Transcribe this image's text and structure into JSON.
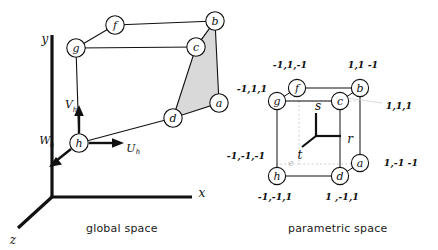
{
  "figure": {
    "width": 438,
    "height": 250,
    "background_color": "#ffffff",
    "line_color": "#111111",
    "shaded_face_color": "#d9d9d9",
    "hidden_edge_color": "#cccccc"
  },
  "panels": {
    "global": {
      "caption": "global space",
      "axes": [
        {
          "name": "x-axis",
          "label": "x"
        },
        {
          "name": "y-axis",
          "label": "y"
        },
        {
          "name": "z-axis",
          "label": "z"
        }
      ],
      "local_vectors": [
        {
          "name": "u-vector",
          "label": "U",
          "subscript": "h"
        },
        {
          "name": "v-vector",
          "label": "V",
          "subscript": "h"
        },
        {
          "name": "w-vector",
          "label": "W",
          "subscript": "h"
        }
      ],
      "nodes": [
        {
          "id": "a",
          "label": "a"
        },
        {
          "id": "b",
          "label": "b"
        },
        {
          "id": "c",
          "label": "c"
        },
        {
          "id": "d",
          "label": "d"
        },
        {
          "id": "f",
          "label": "f"
        },
        {
          "id": "g",
          "label": "g"
        },
        {
          "id": "h",
          "label": "h"
        }
      ]
    },
    "parametric": {
      "caption": "parametric space",
      "axes": [
        {
          "name": "r-axis",
          "label": "r"
        },
        {
          "name": "s-axis",
          "label": "s"
        },
        {
          "name": "t-axis",
          "label": "t"
        }
      ],
      "nodes": [
        {
          "id": "a",
          "label": "a",
          "coords": "1,-1 -1"
        },
        {
          "id": "b",
          "label": "b",
          "coords": "1,1 -1"
        },
        {
          "id": "c",
          "label": "c",
          "coords": "1,1,1"
        },
        {
          "id": "d",
          "label": "d",
          "coords": "1 ,-1,1"
        },
        {
          "id": "e",
          "label": "e",
          "coords": "-1,-1,-1"
        },
        {
          "id": "f",
          "label": "f",
          "coords": "-1,1,-1"
        },
        {
          "id": "g",
          "label": "g",
          "coords": "-1,1,1"
        },
        {
          "id": "h",
          "label": "h",
          "coords": "-1,-1,1"
        }
      ]
    }
  }
}
